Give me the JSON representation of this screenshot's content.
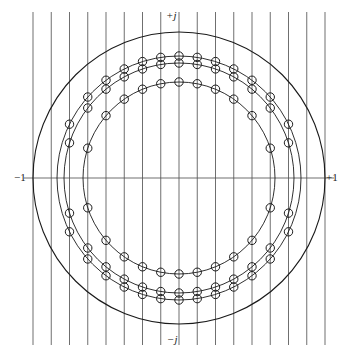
{
  "labels": {
    "imag_positive": "+j",
    "imag_negative": "−j",
    "real_negative": "−1",
    "real_positive": "+1"
  },
  "colors": {
    "curve": "#1a1a1a",
    "grid": "#555555",
    "axis": "#555555",
    "marker_stroke": "#1a1a1a",
    "marker_fill": "#ffffff",
    "background": "#ffffff"
  },
  "chart_data": {
    "type": "scatter",
    "title": "",
    "xlabel": "",
    "ylabel": "",
    "xlim": [
      -1.22,
      1.22
    ],
    "ylim": [
      -1.22,
      1.22
    ],
    "grid": true,
    "legend": null,
    "geometry": {
      "center_px": [
        179,
        178
      ],
      "unit_radius_px": 146
    },
    "axes": {
      "real_axis_y_px": 178,
      "real_axis_ticks": [
        -1,
        1
      ],
      "imag_axis_x_px": 179,
      "imag_axis_ticks": [
        1,
        -1
      ]
    },
    "circles": [
      {
        "name": "unit-circle",
        "radius": 1.0,
        "radius_px": 146,
        "markers": false,
        "stroke_width": 1.1
      },
      {
        "name": "circle-r3",
        "radius": 0.835,
        "radius_px": 122,
        "markers": true,
        "stroke_width": 0.9
      },
      {
        "name": "circle-r2",
        "radius": 0.79,
        "radius_px": 115,
        "markers": true,
        "stroke_width": 0.9
      },
      {
        "name": "circle-r1",
        "radius": 0.66,
        "radius_px": 96,
        "markers": true,
        "stroke_width": 0.9
      }
    ],
    "vertical_gridlines": {
      "count": 17,
      "spacing_px": 18.25,
      "x_px": [
        33.0,
        51.25,
        69.5,
        87.75,
        106.0,
        124.25,
        142.5,
        160.75,
        179.0,
        197.25,
        215.5,
        233.75,
        252.0,
        270.25,
        288.5,
        306.75,
        325.0
      ],
      "x_values": [
        -1.0,
        -0.875,
        -0.75,
        -0.625,
        -0.5,
        -0.375,
        -0.25,
        -0.125,
        0.0,
        0.125,
        0.25,
        0.375,
        0.5,
        0.625,
        0.75,
        0.875,
        1.0
      ]
    },
    "markers": {
      "shape": "open-circle",
      "radius_px": 4.2,
      "description": "Placed at every intersection of the three inner circles with the vertical grid lines, upper and lower half-plane."
    }
  }
}
